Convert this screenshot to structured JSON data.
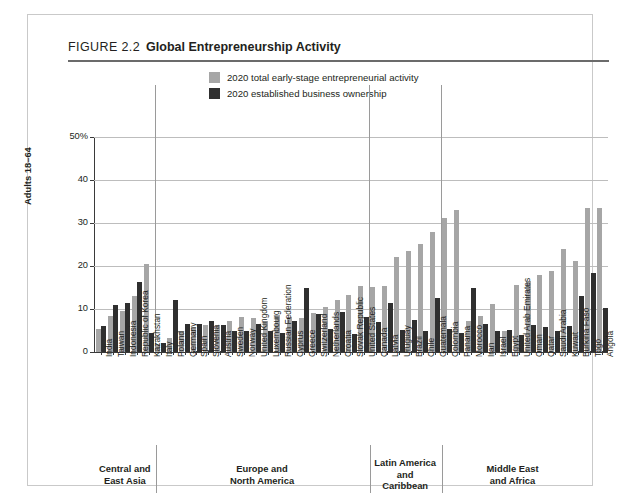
{
  "figure": {
    "number": "FIGURE 2.2",
    "title": "Global Entrepreneurship Activity"
  },
  "legend": {
    "items": [
      {
        "label": "2020 total early-stage entrepreneurial activity",
        "color": "#a6a6a6",
        "key": "tea"
      },
      {
        "label": "2020 established business ownership",
        "color": "#2f2f2f",
        "key": "ebo"
      }
    ]
  },
  "axis": {
    "y_title": "Adults 18–64",
    "y_ticks": [
      "0",
      "10",
      "20",
      "30",
      "40",
      "50%"
    ]
  },
  "regions": [
    {
      "label": "Central and\nEast Asia",
      "line1": "Central and",
      "line2": "East Asia",
      "count": 5
    },
    {
      "label": "Europe and\nNorth America",
      "line1": "Europe and",
      "line2": "North America",
      "count": 18
    },
    {
      "label": "Latin America\nand\nCaribbean",
      "line1": "Latin America",
      "line2": "and",
      "line3": "Caribbean",
      "count": 6
    },
    {
      "label": "Middle East\nand Africa",
      "line1": "Middle East",
      "line2": "and Africa",
      "count": 12
    }
  ],
  "chart_data": {
    "type": "bar",
    "title": "Global Entrepreneurship Activity",
    "xlabel": "",
    "ylabel": "Adults 18–64",
    "ylim": [
      0,
      50
    ],
    "yticks": [
      0,
      10,
      20,
      30,
      40,
      50
    ],
    "grid": true,
    "legend_position": "top-center",
    "categories": [
      "India",
      "Taiwan",
      "Indonesia",
      "Republic of Korea",
      "Kazakhstan",
      "Italy",
      "Poland",
      "Germany",
      "Spain",
      "Slovenia",
      "Austria",
      "Sweden",
      "Norway",
      "United Kingdom",
      "Luxembourg",
      "Russian Federation",
      "Cyprus",
      "Greece",
      "Switzerland",
      "Netherlands",
      "Croatia",
      "Slovak Republic",
      "United States",
      "Canada",
      "Latvia",
      "Uruguay",
      "Brazil",
      "Chile",
      "Guatemala",
      "Colombia",
      "Panama",
      "Morocco",
      "Iran",
      "Israel",
      "Egypt",
      "United Arab Emirates",
      "Oman",
      "Qatar",
      "Saudi Arabia",
      "Kuwait",
      "Burkina Faso",
      "Togo",
      "Angola"
    ],
    "series": [
      {
        "name": "2020 total early-stage entrepreneurial activity",
        "color": "#a6a6a6",
        "values": [
          5.3,
          8.4,
          9.6,
          13.0,
          20.4,
          1.9,
          3.2,
          4.8,
          5.8,
          6.2,
          6.3,
          7.3,
          8.2,
          7.8,
          7.2,
          8.5,
          8.1,
          8.0,
          9.0,
          10.4,
          12.1,
          13.2,
          15.4,
          15.2,
          15.3,
          22.0,
          23.4,
          25.2,
          28.0,
          31.2,
          33.0,
          7.3,
          8.3,
          11.2,
          5.0,
          15.6,
          16.6,
          17.8,
          18.9,
          24.0,
          21.2,
          33.5,
          33.5
        ]
      },
      {
        "name": "2020 established business ownership",
        "color": "#2f2f2f",
        "values": [
          6.0,
          11.0,
          11.4,
          16.2,
          4.4,
          2.2,
          12.1,
          6.4,
          6.6,
          7.2,
          6.3,
          4.9,
          4.8,
          6.4,
          5.0,
          4.4,
          7.1,
          14.9,
          8.8,
          5.3,
          9.3,
          4.1,
          8.1,
          7.0,
          11.4,
          5.2,
          7.4,
          4.9,
          12.6,
          5.4,
          4.4,
          15.0,
          6.4,
          4.9,
          5.2,
          3.9,
          6.3,
          5.8,
          4.8,
          6.0,
          13.0,
          18.3,
          10.3
        ]
      }
    ]
  }
}
